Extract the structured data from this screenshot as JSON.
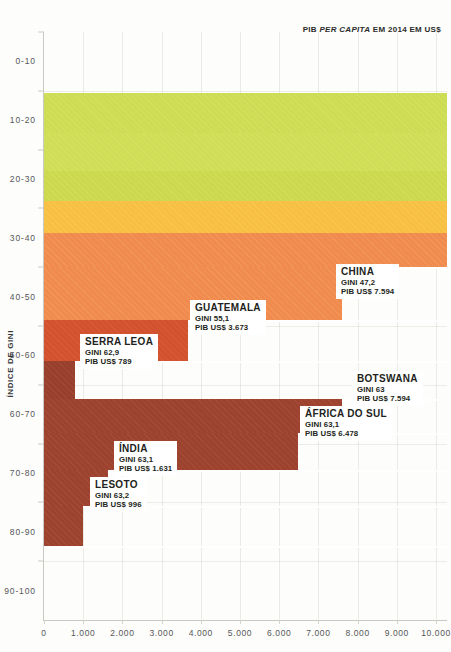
{
  "chart_data": {
    "type": "bar",
    "title": "",
    "xlabel": "PIB PER CAPITA EM 2014 EM US$",
    "ylabel": "ÍNDICE DE GINI",
    "orientation": "horizontal",
    "xlim": [
      0,
      10000
    ],
    "ylim": [
      0,
      100
    ],
    "grid": true,
    "legend": "none",
    "x_ticks": [
      "0",
      "1.000",
      "2.000",
      "3.000",
      "4.000",
      "5.000",
      "6.000",
      "7.000",
      "8.000",
      "9.000",
      "10.000"
    ],
    "x_tick_values": [
      0,
      1000,
      2000,
      3000,
      4000,
      5000,
      6000,
      7000,
      8000,
      9000,
      10000
    ],
    "y_ticks": [
      "0-10",
      "10-20",
      "20-30",
      "30-40",
      "40-50",
      "50-60",
      "60-70",
      "70-80",
      "80-90",
      "90-100"
    ],
    "y_tick_values": [
      5,
      15,
      25,
      35,
      45,
      55,
      65,
      75,
      85,
      95
    ],
    "categories": [
      "Noruega (banda)",
      "Banda verde 2",
      "Banda verde 3",
      "Banda amarela",
      "Banda laranja 1",
      "China",
      "Guatemala",
      "Serra Leoa",
      "Botswana",
      "África do Sul",
      "Índia",
      "Lesoto"
    ],
    "bars": [
      {
        "name": "",
        "gini": 22.0,
        "gdp": 10000,
        "color": "#cddc55",
        "clipped_right": true,
        "labeled": false
      },
      {
        "name": "",
        "gini": 25.8,
        "gdp": 10000,
        "color": "#cfdd57",
        "clipped_right": true,
        "labeled": false
      },
      {
        "name": "",
        "gini": 29.5,
        "gdp": 10000,
        "color": "#ccd94f",
        "clipped_right": true,
        "labeled": false
      },
      {
        "name": "",
        "gini": 33.0,
        "gdp": 10000,
        "color": "#f8bf45",
        "clipped_right": true,
        "labeled": false
      },
      {
        "name": "",
        "gini": 37.0,
        "gdp": 10000,
        "color": "#f08a4e",
        "clipped_right": true,
        "labeled": false
      },
      {
        "name": "CHINA",
        "gini_text": "GINI 47,2",
        "gdp_text": "PIB US$ 7.594",
        "gini": 47.2,
        "gdp": 7594,
        "color": "#f08a4e",
        "labeled": true
      },
      {
        "name": "GUATEMALA",
        "gini_text": "GINI 55,1",
        "gdp_text": "PIB US$ 3.673",
        "gini": 55.1,
        "gdp": 3673,
        "color": "#d2522f",
        "labeled": true
      },
      {
        "name": "SERRA LEOA",
        "gini_text": "GINI 62,9",
        "gdp_text": "PIB US$ 789",
        "gini": 62.9,
        "gdp": 789,
        "color": "#97402e",
        "labeled": true
      },
      {
        "name": "BOTSWANA",
        "gini_text": "GINI 63",
        "gdp_text": "PIB US$ 7.594",
        "gini": 63.0,
        "gdp": 7594,
        "color": "#9c4330",
        "labeled": true
      },
      {
        "name": "ÁFRICA DO SUL",
        "gini_text": "GINI 63,1",
        "gdp_text": "PIB US$ 6.478",
        "gini": 63.1,
        "gdp": 6478,
        "color": "#9c4330",
        "labeled": true
      },
      {
        "name": "ÍNDIA",
        "gini_text": "GINI 63,1",
        "gdp_text": "PIB US$ 1.631",
        "gini": 63.1,
        "gdp": 1631,
        "color": "#9c4330",
        "labeled": true
      },
      {
        "name": "LESOTO",
        "gini_text": "GINI 63,2",
        "gdp_text": "PIB US$ 996",
        "gini": 63.2,
        "gdp": 996,
        "color": "#9c4330",
        "labeled": true
      }
    ]
  },
  "axes": {
    "y_title": "ÍNDICE DE GINI",
    "x_title_prefix": "PIB ",
    "x_title_italic": "PER CAPITA",
    "x_title_suffix": " EM 2014 EM US$",
    "y_labels": [
      "0-10",
      "10-20",
      "20-30",
      "30-40",
      "40-50",
      "50-60",
      "60-70",
      "70-80",
      "80-90",
      "90-100"
    ],
    "x_labels": [
      "0",
      "1.000",
      "2.000",
      "3.000",
      "4.000",
      "5.000",
      "6.000",
      "7.000",
      "8.000",
      "9.000",
      "10.000"
    ]
  },
  "colors": {
    "green": "#cddc55",
    "yellow": "#f8bf45",
    "orange": "#f08a4e",
    "red_orange": "#d2522f",
    "dark_red": "#9c4330",
    "background": "#fdfdfb",
    "axis": "#c9c9c4",
    "text": "#231f20"
  },
  "callouts": [
    {
      "id": "china",
      "name": "CHINA",
      "gini_text": "GINI 47,2",
      "gdp_text": "PIB US$ 7.594"
    },
    {
      "id": "guatemala",
      "name": "GUATEMALA",
      "gini_text": "GINI 55,1",
      "gdp_text": "PIB US$ 3.673"
    },
    {
      "id": "serra-leoa",
      "name": "SERRA LEOA",
      "gini_text": "GINI 62,9",
      "gdp_text": "PIB US$ 789"
    },
    {
      "id": "botswana",
      "name": "BOTSWANA",
      "gini_text": "GINI 63",
      "gdp_text": "PIB US$ 7.594"
    },
    {
      "id": "africa-do-sul",
      "name": "ÁFRICA DO SUL",
      "gini_text": "GINI 63,1",
      "gdp_text": "PIB US$ 6.478"
    },
    {
      "id": "india",
      "name": "ÍNDIA",
      "gini_text": "GINI 63,1",
      "gdp_text": "PIB US$ 1.631"
    },
    {
      "id": "lesoto",
      "name": "LESOTO",
      "gini_text": "GINI 63,2",
      "gdp_text": "PIB US$ 996"
    }
  ]
}
